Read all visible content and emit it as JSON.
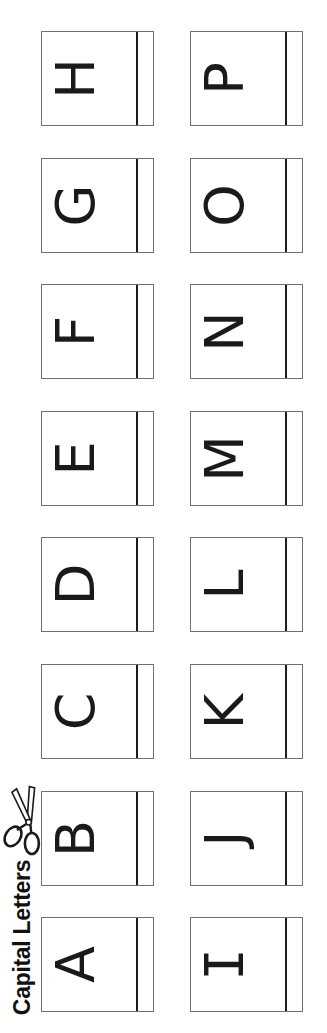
{
  "title": {
    "text": "Capital Letters"
  },
  "cards": {
    "letters_row_major": [
      "H",
      "P",
      "G",
      "O",
      "F",
      "N",
      "E",
      "M",
      "D",
      "L",
      "C",
      "K",
      "B",
      "J",
      "A",
      "I"
    ],
    "left_column_top_to_bottom": "H G F E D C B A",
    "right_column_top_to_bottom": "P O N M L K J I"
  },
  "icons": {
    "scissors": "scissors-icon"
  },
  "colors": {
    "background": "#ffffff",
    "card_border": "#707070",
    "divider_line": "#1d1d1d",
    "letter_ink": "#1a1a1a",
    "title_ink": "#111111"
  }
}
